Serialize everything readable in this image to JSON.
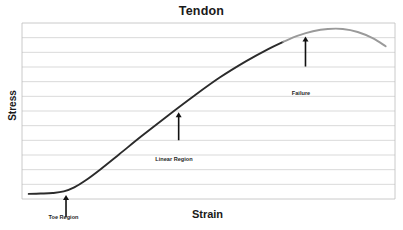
{
  "chart_data": {
    "type": "line",
    "title": "Tendon",
    "xlabel": "Strain",
    "ylabel": "Stress",
    "grid": true,
    "legend": "none",
    "xlim": [
      0,
      1
    ],
    "ylim": [
      0,
      1
    ],
    "axis_ticks": {
      "x": [],
      "y": []
    },
    "gridline_count": 11,
    "series": [
      {
        "name": "toe-and-linear",
        "color": "#2b2b2b",
        "comment": "dark segment: toe region then linear region up to near the peak",
        "points": [
          [
            0.018,
            0.029
          ],
          [
            0.05,
            0.031
          ],
          [
            0.082,
            0.034
          ],
          [
            0.112,
            0.043
          ],
          [
            0.14,
            0.066
          ],
          [
            0.17,
            0.105
          ],
          [
            0.21,
            0.168
          ],
          [
            0.26,
            0.253
          ],
          [
            0.32,
            0.356
          ],
          [
            0.39,
            0.472
          ],
          [
            0.46,
            0.584
          ],
          [
            0.53,
            0.69
          ],
          [
            0.6,
            0.782
          ],
          [
            0.66,
            0.852
          ],
          [
            0.7,
            0.893
          ]
        ]
      },
      {
        "name": "failure",
        "color": "#9a9a9a",
        "comment": "light gray segment: yield, peak and drop off at failure",
        "points": [
          [
            0.7,
            0.893
          ],
          [
            0.74,
            0.928
          ],
          [
            0.78,
            0.953
          ],
          [
            0.82,
            0.966
          ],
          [
            0.86,
            0.966
          ],
          [
            0.9,
            0.949
          ],
          [
            0.94,
            0.914
          ],
          [
            0.975,
            0.868
          ]
        ]
      }
    ],
    "annotations": [
      {
        "name": "toe-region",
        "label": "Toe Region",
        "x": 0.118,
        "y": 0.04,
        "arrow": "up"
      },
      {
        "name": "linear-region",
        "label": "Linear Region",
        "x": 0.42,
        "y": 0.51,
        "arrow": "up"
      },
      {
        "name": "failure",
        "label": "Failure",
        "x": 0.76,
        "y": 0.94,
        "arrow": "up"
      }
    ]
  },
  "figure": {
    "title": "Tendon",
    "x_axis_label": "Strain",
    "y_axis_label": "Stress",
    "annotations": {
      "toe_region": "Toe Region",
      "linear_region": "Linear Region",
      "failure": "Failure"
    },
    "colors": {
      "background": "#ffffff",
      "curve_dark": "#2b2b2b",
      "curve_light": "#9a9a9a",
      "gridline": "#cfcfcf",
      "axis_border": "#bdbdbd",
      "text": "#1a1a1a"
    }
  }
}
